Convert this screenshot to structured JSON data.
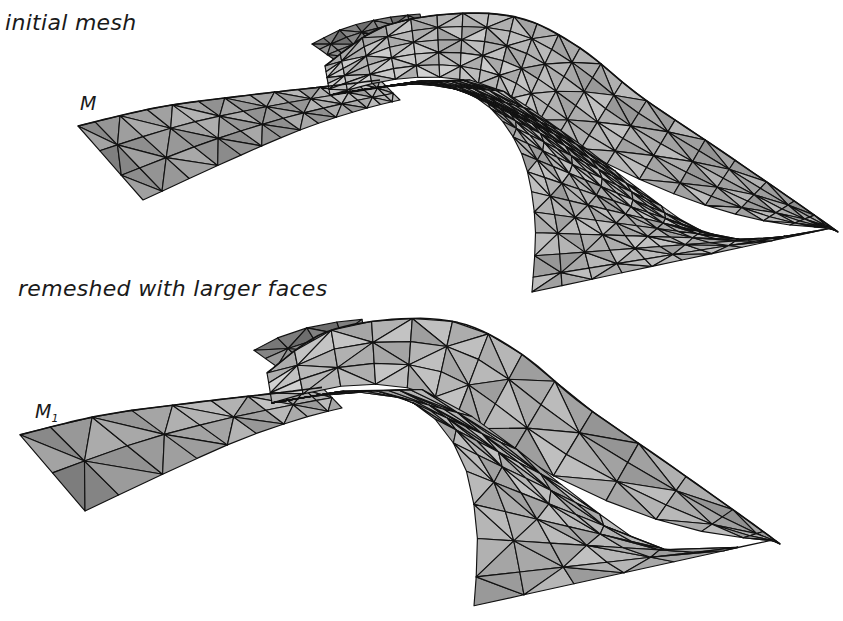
{
  "figure": {
    "panels": [
      {
        "caption": "initial mesh",
        "mesh_label": "M",
        "mesh_label_subscript": "",
        "description": "fine triangulated freeform surface"
      },
      {
        "caption": "remeshed with larger faces",
        "mesh_label": "M",
        "mesh_label_subscript": "1",
        "description": "coarser triangulated freeform surface"
      }
    ],
    "colors": {
      "background": "#ffffff",
      "edge": "#111111",
      "face_light": "#d6d6d6",
      "face_mid": "#b4b4b4",
      "face_dark": "#8e8e8e",
      "text": "#1a1a1a"
    }
  }
}
